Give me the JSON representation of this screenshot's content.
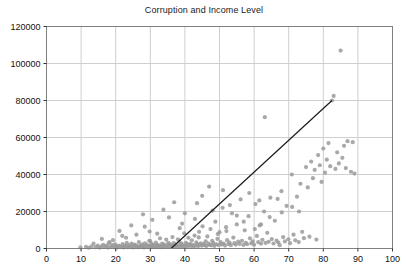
{
  "chart_data": {
    "type": "scatter",
    "title": "Corruption and Income Level",
    "xlabel": "",
    "ylabel": "",
    "xlim": [
      0,
      100
    ],
    "ylim": [
      0,
      120000
    ],
    "xticks": [
      0,
      10,
      20,
      30,
      40,
      50,
      60,
      70,
      80,
      90,
      100
    ],
    "yticks": [
      0,
      20000,
      40000,
      60000,
      80000,
      100000,
      120000
    ],
    "grid": true,
    "legend": null,
    "marker_color": "#9a9a9a",
    "trendline_color": "#1a1a1a",
    "axis_color": "#808080",
    "grid_color": "#cfcfcf",
    "trendline": {
      "name": "linear fit",
      "x_start": 36.0,
      "y_start": 0,
      "x_end": 82.5,
      "y_end": 80000
    },
    "series": [
      {
        "name": "Countries",
        "points": [
          [
            9.8,
            600
          ],
          [
            11.4,
            900
          ],
          [
            12.2,
            400
          ],
          [
            13.0,
            1200
          ],
          [
            13.6,
            2600
          ],
          [
            14.2,
            700
          ],
          [
            14.8,
            1500
          ],
          [
            15.3,
            500
          ],
          [
            15.9,
            1100
          ],
          [
            16.4,
            2000
          ],
          [
            16.9,
            800
          ],
          [
            17.3,
            1400
          ],
          [
            17.8,
            600
          ],
          [
            18.2,
            3400
          ],
          [
            18.6,
            900
          ],
          [
            19.0,
            1800
          ],
          [
            19.4,
            700
          ],
          [
            19.8,
            2200
          ],
          [
            20.1,
            1000
          ],
          [
            20.4,
            500
          ],
          [
            20.8,
            1600
          ],
          [
            21.1,
            9500
          ],
          [
            21.4,
            1200
          ],
          [
            21.7,
            800
          ],
          [
            22.0,
            2400
          ],
          [
            22.3,
            600
          ],
          [
            22.6,
            1500
          ],
          [
            22.9,
            1000
          ],
          [
            23.2,
            3000
          ],
          [
            23.5,
            700
          ],
          [
            23.8,
            1900
          ],
          [
            24.0,
            1100
          ],
          [
            24.3,
            800
          ],
          [
            24.6,
            2700
          ],
          [
            24.9,
            1400
          ],
          [
            25.1,
            600
          ],
          [
            25.4,
            2100
          ],
          [
            25.7,
            900
          ],
          [
            25.9,
            1700
          ],
          [
            26.2,
            1200
          ],
          [
            26.4,
            700
          ],
          [
            26.7,
            3500
          ],
          [
            27.0,
            1000
          ],
          [
            27.2,
            1500
          ],
          [
            27.5,
            800
          ],
          [
            27.7,
            2300
          ],
          [
            28.0,
            1300
          ],
          [
            28.2,
            600
          ],
          [
            28.5,
            2800
          ],
          [
            28.7,
            1100
          ],
          [
            29.0,
            1900
          ],
          [
            29.2,
            900
          ],
          [
            29.5,
            1600
          ],
          [
            29.7,
            4200
          ],
          [
            30.0,
            1200
          ],
          [
            30.2,
            700
          ],
          [
            30.4,
            2500
          ],
          [
            30.7,
            1000
          ],
          [
            30.9,
            1800
          ],
          [
            31.1,
            1400
          ],
          [
            31.4,
            800
          ],
          [
            31.6,
            3200
          ],
          [
            31.8,
            1100
          ],
          [
            32.1,
            2000
          ],
          [
            32.3,
            900
          ],
          [
            32.5,
            1600
          ],
          [
            32.8,
            5500
          ],
          [
            33.0,
            1300
          ],
          [
            33.2,
            700
          ],
          [
            33.4,
            2600
          ],
          [
            33.7,
            1000
          ],
          [
            33.9,
            2200
          ],
          [
            34.1,
            1500
          ],
          [
            34.3,
            800
          ],
          [
            34.6,
            4800
          ],
          [
            34.8,
            1200
          ],
          [
            35.0,
            1900
          ],
          [
            35.2,
            3000
          ],
          [
            35.5,
            1000
          ],
          [
            35.7,
            2400
          ],
          [
            35.9,
            1400
          ],
          [
            36.1,
            900
          ],
          [
            36.4,
            6200
          ],
          [
            36.6,
            1700
          ],
          [
            36.8,
            2900
          ],
          [
            37.0,
            1100
          ],
          [
            37.3,
            2100
          ],
          [
            37.5,
            1500
          ],
          [
            37.7,
            800
          ],
          [
            38.0,
            5000
          ],
          [
            38.2,
            1300
          ],
          [
            38.4,
            3600
          ],
          [
            38.7,
            2000
          ],
          [
            38.9,
            1000
          ],
          [
            39.1,
            2700
          ],
          [
            39.4,
            1600
          ],
          [
            39.6,
            900
          ],
          [
            39.8,
            8200
          ],
          [
            40.1,
            1400
          ],
          [
            40.3,
            3100
          ],
          [
            40.6,
            2300
          ],
          [
            40.8,
            1100
          ],
          [
            41.0,
            5800
          ],
          [
            41.3,
            1800
          ],
          [
            41.5,
            2500
          ],
          [
            41.8,
            1300
          ],
          [
            42.0,
            4400
          ],
          [
            42.3,
            2000
          ],
          [
            42.5,
            1000
          ],
          [
            42.8,
            7000
          ],
          [
            43.0,
            1600
          ],
          [
            43.3,
            3300
          ],
          [
            43.6,
            2200
          ],
          [
            43.8,
            1200
          ],
          [
            44.1,
            9000
          ],
          [
            44.3,
            1900
          ],
          [
            44.6,
            2800
          ],
          [
            44.9,
            1500
          ],
          [
            45.1,
            12000
          ],
          [
            45.4,
            2400
          ],
          [
            45.7,
            1800
          ],
          [
            46.0,
            3900
          ],
          [
            46.2,
            1300
          ],
          [
            46.5,
            6500
          ],
          [
            46.8,
            2600
          ],
          [
            47.1,
            2000
          ],
          [
            47.4,
            10500
          ],
          [
            47.6,
            1700
          ],
          [
            47.9,
            4100
          ],
          [
            48.2,
            3000
          ],
          [
            48.5,
            1400
          ],
          [
            48.8,
            14500
          ],
          [
            49.1,
            2300
          ],
          [
            49.4,
            5200
          ],
          [
            49.7,
            1900
          ],
          [
            50.0,
            8800
          ],
          [
            50.3,
            3500
          ],
          [
            50.6,
            2100
          ],
          [
            50.9,
            22000
          ],
          [
            51.2,
            2700
          ],
          [
            51.6,
            1600
          ],
          [
            51.9,
            11500
          ],
          [
            52.2,
            4500
          ],
          [
            52.6,
            2400
          ],
          [
            52.9,
            3200
          ],
          [
            53.3,
            1800
          ],
          [
            53.6,
            19000
          ],
          [
            54.0,
            5900
          ],
          [
            54.3,
            2900
          ],
          [
            54.7,
            2100
          ],
          [
            55.0,
            13000
          ],
          [
            55.4,
            3700
          ],
          [
            55.8,
            2500
          ],
          [
            56.1,
            26500
          ],
          [
            56.5,
            4200
          ],
          [
            56.9,
            1900
          ],
          [
            57.3,
            9800
          ],
          [
            57.6,
            3100
          ],
          [
            58.0,
            2300
          ],
          [
            58.4,
            17500
          ],
          [
            58.8,
            5500
          ],
          [
            59.2,
            2800
          ],
          [
            59.6,
            3900
          ],
          [
            60.0,
            2000
          ],
          [
            60.4,
            24000
          ],
          [
            60.8,
            6800
          ],
          [
            61.2,
            3400
          ],
          [
            61.6,
            12500
          ],
          [
            62.0,
            2600
          ],
          [
            62.4,
            4700
          ],
          [
            62.9,
            20000
          ],
          [
            63.1,
            71000
          ],
          [
            63.3,
            3000
          ],
          [
            63.8,
            8500
          ],
          [
            64.2,
            3600
          ],
          [
            64.7,
            27500
          ],
          [
            65.1,
            5100
          ],
          [
            65.6,
            2700
          ],
          [
            66.0,
            15000
          ],
          [
            66.5,
            4300
          ],
          [
            67.0,
            3200
          ],
          [
            67.4,
            1800
          ],
          [
            67.9,
            31000
          ],
          [
            68.4,
            6200
          ],
          [
            68.9,
            3800
          ],
          [
            69.4,
            23000
          ],
          [
            69.9,
            5000
          ],
          [
            70.4,
            2900
          ],
          [
            70.9,
            40000
          ],
          [
            71.4,
            7500
          ],
          [
            71.9,
            4400
          ],
          [
            72.4,
            28000
          ],
          [
            72.9,
            3500
          ],
          [
            73.4,
            35000
          ],
          [
            73.9,
            9000
          ],
          [
            74.4,
            5600
          ],
          [
            75.0,
            44000
          ],
          [
            75.5,
            33000
          ],
          [
            76.0,
            6400
          ],
          [
            76.5,
            47000
          ],
          [
            77.0,
            38000
          ],
          [
            77.5,
            42500
          ],
          [
            78.0,
            4800
          ],
          [
            78.5,
            50500
          ],
          [
            79.0,
            45000
          ],
          [
            79.5,
            36000
          ],
          [
            80.0,
            54000
          ],
          [
            80.5,
            41000
          ],
          [
            81.0,
            48000
          ],
          [
            81.5,
            57000
          ],
          [
            82.0,
            44500
          ],
          [
            82.5,
            80000
          ],
          [
            83.0,
            82500
          ],
          [
            83.5,
            43000
          ],
          [
            84.0,
            52000
          ],
          [
            84.5,
            46000
          ],
          [
            85.0,
            107000
          ],
          [
            85.5,
            49000
          ],
          [
            86.0,
            55500
          ],
          [
            86.5,
            43500
          ],
          [
            87.0,
            58000
          ],
          [
            88.0,
            41500
          ],
          [
            88.5,
            57500
          ],
          [
            89.0,
            40500
          ],
          [
            30.6,
            15500
          ],
          [
            27.9,
            18500
          ],
          [
            24.5,
            12500
          ],
          [
            21.9,
            6800
          ],
          [
            33.8,
            21000
          ],
          [
            36.9,
            25000
          ],
          [
            29.8,
            9200
          ],
          [
            42.9,
            16000
          ],
          [
            39.2,
            13500
          ],
          [
            48.0,
            20500
          ],
          [
            53.0,
            23500
          ],
          [
            45.0,
            28500
          ],
          [
            58.6,
            30000
          ],
          [
            61.5,
            26000
          ],
          [
            64.5,
            17000
          ],
          [
            68.0,
            19500
          ],
          [
            71.0,
            22500
          ],
          [
            26.0,
            7500
          ],
          [
            19.2,
            4500
          ],
          [
            16.0,
            5200
          ],
          [
            51.0,
            31500
          ],
          [
            55.0,
            17800
          ],
          [
            43.5,
            24500
          ],
          [
            47.0,
            33500
          ],
          [
            38.5,
            11000
          ],
          [
            32.0,
            8000
          ],
          [
            35.4,
            16800
          ],
          [
            40.0,
            19000
          ],
          [
            57.0,
            14500
          ],
          [
            60.2,
            10500
          ],
          [
            66.8,
            26800
          ],
          [
            73.0,
            20000
          ],
          [
            62.0,
            13000
          ],
          [
            49.5,
            7800
          ],
          [
            44.0,
            6000
          ],
          [
            52.0,
            9400
          ],
          [
            30.0,
            4000
          ],
          [
            23.0,
            5800
          ],
          [
            18.0,
            2900
          ],
          [
            28.4,
            11800
          ]
        ]
      }
    ]
  }
}
